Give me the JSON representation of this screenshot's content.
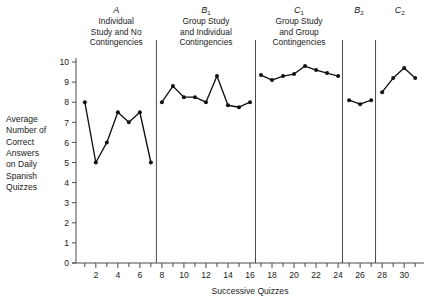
{
  "chart_data": {
    "type": "line",
    "title": "",
    "xlabel": "Successive Quizzes",
    "ylabel": "Average Number of Correct Answers on Daily Spanish Quizzes",
    "ylabel_lines": [
      "Average",
      "Number of",
      "Correct",
      "Answers",
      "on Daily",
      "Spanish",
      "Quizzes"
    ],
    "xlim": [
      0.2,
      31.8
    ],
    "ylim": [
      0,
      10
    ],
    "ytick_labels": [
      "0",
      "1",
      "2",
      "3",
      "4",
      "5",
      "6",
      "7",
      "8",
      "9",
      "10"
    ],
    "ytick_values": [
      0,
      1,
      2,
      3,
      4,
      5,
      6,
      7,
      8,
      9,
      10
    ],
    "xtick_labels": [
      "2",
      "4",
      "6",
      "8",
      "10",
      "12",
      "14",
      "16",
      "18",
      "20",
      "22",
      "24",
      "26",
      "28",
      "30"
    ],
    "xtick_values": [
      2,
      4,
      6,
      8,
      10,
      12,
      14,
      16,
      18,
      20,
      22,
      24,
      26,
      28,
      30
    ],
    "xtick_minor": [
      1,
      3,
      5,
      7,
      9,
      11,
      13,
      15,
      17,
      19,
      21,
      23,
      25,
      27,
      29,
      31
    ],
    "grid": false,
    "legend": "none",
    "marker": "filled-circle",
    "line_color": "#111111",
    "phase_dividers": [
      7.5,
      16.5,
      24.4,
      27.4
    ],
    "phases": [
      {
        "id": "A",
        "label": "A",
        "label_sub": "",
        "description_lines": [
          "Individual",
          "Study and No",
          "Contingencies"
        ],
        "x": [
          1,
          2,
          3,
          4,
          5,
          6,
          7
        ],
        "values": [
          8.0,
          5.0,
          6.0,
          7.5,
          7.0,
          7.5,
          5.0
        ]
      },
      {
        "id": "B1",
        "label": "B",
        "label_sub": "1",
        "description_lines": [
          "Group Study",
          "and Individual",
          "Contingencies"
        ],
        "x": [
          8,
          9,
          10,
          11,
          12,
          13,
          14,
          15,
          16
        ],
        "values": [
          8.0,
          8.8,
          8.25,
          8.25,
          8.0,
          9.3,
          7.85,
          7.75,
          8.0
        ]
      },
      {
        "id": "C1",
        "label": "C",
        "label_sub": "1",
        "description_lines": [
          "Group Study",
          "and Group",
          "Contingencies"
        ],
        "x": [
          17,
          18,
          19,
          20,
          21,
          22,
          23,
          24
        ],
        "values": [
          9.35,
          9.1,
          9.3,
          9.4,
          9.8,
          9.6,
          9.45,
          9.3
        ]
      },
      {
        "id": "B2",
        "label": "B",
        "label_sub": "2",
        "description_lines": [],
        "x": [
          25,
          26,
          27
        ],
        "values": [
          8.1,
          7.9,
          8.1
        ]
      },
      {
        "id": "C2",
        "label": "C",
        "label_sub": "2",
        "description_lines": [],
        "x": [
          28,
          29,
          30,
          31
        ],
        "values": [
          8.5,
          9.2,
          9.7,
          9.2
        ]
      }
    ]
  }
}
